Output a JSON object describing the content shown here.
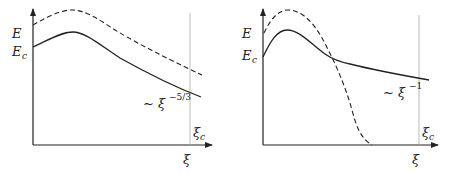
{
  "panels": [
    {
      "id": "left",
      "y_labels": {
        "E": "E",
        "Ec_main": "E",
        "Ec_sub": "c"
      },
      "x_label": "ξ",
      "xi_c_main": "ξ",
      "xi_c_sub": "c",
      "scaling": {
        "prefix": "~ ξ",
        "exponent": "−5/3"
      },
      "curves": [
        {
          "name": "solid",
          "style": "solid",
          "description": "E(ξ) rises to peak then decays as ξ^-5/3"
        },
        {
          "name": "dashed",
          "style": "dashed",
          "description": "parallel curve above solid"
        }
      ]
    },
    {
      "id": "right",
      "y_labels": {
        "E": "E",
        "Ec_main": "E",
        "Ec_sub": "c"
      },
      "x_label": "ξ",
      "xi_c_main": "ξ",
      "xi_c_sub": "c",
      "scaling": {
        "prefix": "~ ξ",
        "exponent": "−1"
      },
      "curves": [
        {
          "name": "solid",
          "style": "solid",
          "description": "E(ξ) rises to peak then decays as ξ^-1"
        },
        {
          "name": "dashed",
          "style": "dashed",
          "description": "rises higher then drops steeply to zero"
        }
      ]
    }
  ],
  "colors": {
    "line": "#222222",
    "vline": "#999999"
  }
}
